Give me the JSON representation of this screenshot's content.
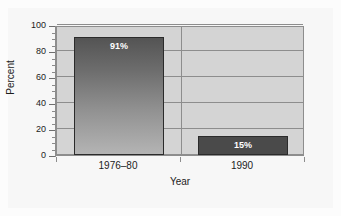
{
  "chart_data": {
    "type": "bar",
    "title": "",
    "subtitle": "",
    "xlabel": "Year",
    "ylabel": "Percent",
    "categories": [
      "1976–80",
      "1990"
    ],
    "values": [
      91,
      15
    ],
    "value_labels": [
      "91%",
      "15%"
    ],
    "ylim": [
      0,
      100
    ],
    "yticks": [
      0,
      20,
      40,
      60,
      80,
      100
    ],
    "ytick_labels": [
      "0",
      "20",
      "40",
      "60",
      "80",
      "100"
    ],
    "yminor_step": 5,
    "grid": "horizontal",
    "legend": "none",
    "series": [
      {
        "name": "Percent",
        "values": [
          91,
          15
        ]
      }
    ],
    "bar_styles": [
      {
        "fill": "gradient",
        "from": "#545454",
        "to": "#b4b4b4",
        "border": "#2b2b2b"
      },
      {
        "fill": "solid",
        "color": "#4a4a4a",
        "border": "#2b2b2b"
      }
    ],
    "colors": {
      "plot_background": "#d4d4d4",
      "figure_background": "#f7f7f7",
      "gridline": "#8d8d8d",
      "axis": "#8d8d8d",
      "text": "#1c1c1c",
      "value_label_text": "#ffffff"
    }
  }
}
